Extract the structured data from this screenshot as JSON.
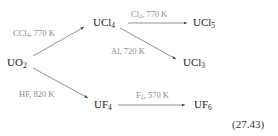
{
  "species": {
    "uo2": {
      "base": "UO",
      "sub": "2"
    },
    "ucl4": {
      "base": "UCl",
      "sub": "4"
    },
    "ucl5": {
      "base": "UCl",
      "sub": "5"
    },
    "ucl3": {
      "base": "UCl",
      "sub": "3"
    },
    "uf4": {
      "base": "UF",
      "sub": "4"
    },
    "uf6": {
      "base": "UF",
      "sub": "6"
    }
  },
  "conditions": {
    "uo2_to_ucl4": {
      "pre": "CCl",
      "sub": "4",
      "post": ", 770 K"
    },
    "ucl4_to_ucl5": {
      "pre": "Cl",
      "sub": "2",
      "post": ", 770 K"
    },
    "ucl4_to_ucl3": {
      "pre": "Al, 720 K",
      "sub": "",
      "post": ""
    },
    "uo2_to_uf4": {
      "pre": "HF, 820 K",
      "sub": "",
      "post": ""
    },
    "uf4_to_uf6": {
      "pre": "F",
      "sub": "2",
      "post": ", 570 K"
    }
  },
  "equation_number": "(27.43)",
  "colors": {
    "species_text": "#222222",
    "condition_text": "#8a8a8a",
    "arrow": "#555555"
  }
}
